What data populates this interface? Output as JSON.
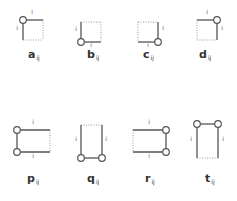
{
  "diagram": {
    "title": "",
    "stroke_color": "#555555",
    "dotted_color": "#9a9a9a",
    "node_fill": "#ffffff",
    "index_letter": "i",
    "figures": [
      {
        "id": "a",
        "label": "a",
        "sub": "ij",
        "label_pos": [
          28,
          57
        ],
        "rect": [
          23,
          20,
          43,
          40
        ],
        "solid": [
          [
            23,
            20,
            43,
            20
          ],
          [
            23,
            20,
            23,
            40
          ]
        ],
        "dotted": [
          [
            43,
            20,
            43,
            40
          ],
          [
            23,
            40,
            43,
            40
          ]
        ],
        "nodes": [
          [
            23,
            20
          ]
        ],
        "ticks": [
          {
            "t": "i",
            "x": 32,
            "y": 14
          },
          {
            "t": "i",
            "x": 17,
            "y": 30
          }
        ]
      },
      {
        "id": "b",
        "label": "b",
        "sub": "ij",
        "label_pos": [
          87,
          57
        ],
        "rect": [
          81,
          22,
          101,
          42
        ],
        "solid": [
          [
            81,
            22,
            81,
            42
          ],
          [
            81,
            42,
            101,
            42
          ]
        ],
        "dotted": [
          [
            81,
            22,
            101,
            22
          ],
          [
            101,
            22,
            101,
            42
          ]
        ],
        "nodes": [
          [
            81,
            42
          ]
        ],
        "ticks": [
          {
            "t": "i",
            "x": 76,
            "y": 31
          },
          {
            "t": "i",
            "x": 91,
            "y": 47
          }
        ]
      },
      {
        "id": "c",
        "label": "c",
        "sub": "ij",
        "label_pos": [
          143,
          57
        ],
        "rect": [
          138,
          22,
          158,
          42
        ],
        "solid": [
          [
            158,
            22,
            158,
            42
          ],
          [
            138,
            42,
            158,
            42
          ]
        ],
        "dotted": [
          [
            138,
            22,
            158,
            22
          ],
          [
            138,
            22,
            138,
            42
          ]
        ],
        "nodes": [
          [
            158,
            42
          ]
        ],
        "ticks": [
          {
            "t": "i",
            "x": 163,
            "y": 30
          },
          {
            "t": "i",
            "x": 148,
            "y": 47
          }
        ]
      },
      {
        "id": "d",
        "label": "d",
        "sub": "ij",
        "label_pos": [
          199,
          57
        ],
        "rect": [
          197,
          20,
          217,
          40
        ],
        "solid": [
          [
            197,
            20,
            217,
            20
          ],
          [
            217,
            20,
            217,
            40
          ]
        ],
        "dotted": [
          [
            197,
            20,
            197,
            40
          ],
          [
            197,
            40,
            217,
            40
          ]
        ],
        "nodes": [
          [
            217,
            20
          ]
        ],
        "ticks": [
          {
            "t": "i",
            "x": 207,
            "y": 14
          },
          {
            "t": "i",
            "x": 222,
            "y": 30
          }
        ]
      },
      {
        "id": "p",
        "label": "p",
        "sub": "ij",
        "label_pos": [
          27,
          181
        ],
        "rect": [
          17,
          130,
          50,
          152
        ],
        "solid": [
          [
            17,
            130,
            50,
            130
          ],
          [
            17,
            152,
            50,
            152
          ],
          [
            17,
            130,
            17,
            152
          ]
        ],
        "dotted": [
          [
            50,
            130,
            50,
            152
          ]
        ],
        "nodes": [
          [
            17,
            130
          ],
          [
            17,
            152
          ]
        ],
        "ticks": [
          {
            "t": "i",
            "x": 33,
            "y": 124
          },
          {
            "t": "i",
            "x": 33,
            "y": 158
          }
        ]
      },
      {
        "id": "q",
        "label": "q",
        "sub": "ij",
        "label_pos": [
          87,
          181
        ],
        "rect": [
          81,
          125,
          102,
          158
        ],
        "solid": [
          [
            81,
            125,
            81,
            158
          ],
          [
            102,
            125,
            102,
            158
          ],
          [
            81,
            158,
            102,
            158
          ]
        ],
        "dotted": [
          [
            81,
            125,
            102,
            125
          ]
        ],
        "nodes": [
          [
            81,
            158
          ],
          [
            102,
            158
          ]
        ],
        "ticks": [
          {
            "t": "i",
            "x": 76,
            "y": 141
          },
          {
            "t": "i",
            "x": 106,
            "y": 141
          }
        ]
      },
      {
        "id": "r",
        "label": "r",
        "sub": "ij",
        "label_pos": [
          145,
          181
        ],
        "rect": [
          133,
          130,
          166,
          152
        ],
        "solid": [
          [
            133,
            130,
            166,
            130
          ],
          [
            133,
            152,
            166,
            152
          ],
          [
            166,
            130,
            166,
            152
          ]
        ],
        "dotted": [
          [
            133,
            130,
            133,
            152
          ]
        ],
        "nodes": [
          [
            166,
            130
          ],
          [
            166,
            152
          ]
        ],
        "ticks": [
          {
            "t": "i",
            "x": 149,
            "y": 124
          },
          {
            "t": "i",
            "x": 149,
            "y": 158
          }
        ]
      },
      {
        "id": "t",
        "label": "t",
        "sub": "ij",
        "label_pos": [
          205,
          181
        ],
        "rect": [
          197,
          124,
          218,
          158
        ],
        "solid": [
          [
            197,
            124,
            218,
            124
          ],
          [
            197,
            124,
            197,
            158
          ],
          [
            218,
            124,
            218,
            158
          ]
        ],
        "dotted": [
          [
            197,
            158,
            218,
            158
          ]
        ],
        "nodes": [
          [
            197,
            124
          ],
          [
            218,
            124
          ]
        ],
        "ticks": [
          {
            "t": "i",
            "x": 191,
            "y": 141
          },
          {
            "t": "i",
            "x": 223,
            "y": 141
          }
        ]
      }
    ]
  }
}
